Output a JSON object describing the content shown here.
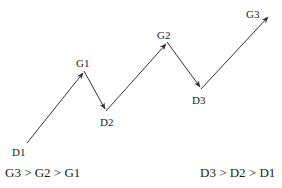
{
  "diagram": {
    "points": [
      {
        "id": "D1",
        "label": "D1"
      },
      {
        "id": "G1",
        "label": "G1"
      },
      {
        "id": "D2",
        "label": "D2"
      },
      {
        "id": "G2",
        "label": "G2"
      },
      {
        "id": "D3",
        "label": "D3"
      },
      {
        "id": "G3",
        "label": "G3"
      }
    ],
    "comparisons": {
      "peaks": "G3 > G2 > G1",
      "troughs": "D3 > D2 > D1"
    },
    "line_color": "#333333"
  }
}
